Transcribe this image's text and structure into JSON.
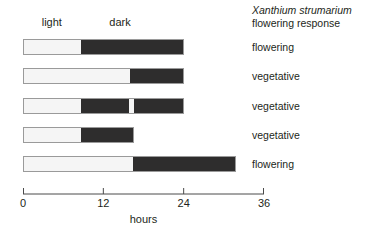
{
  "chart_data": {
    "type": "bar",
    "title": "Xanthium strumarium flowering response",
    "title_species": "Xanthium strumarium",
    "title_subtitle": "flowering response",
    "xlabel": "hours",
    "ylabel": "",
    "xlim": [
      0,
      36
    ],
    "xticks": [
      0,
      12,
      24,
      36
    ],
    "xtick_labels": [
      "0",
      "12",
      "24",
      "36"
    ],
    "grid": false,
    "legend_position": "top",
    "column_headers": [
      {
        "label": "light",
        "hours": 4.3
      },
      {
        "label": "dark",
        "hours": 14.5
      }
    ],
    "segment_colors": {
      "light": "#f5f5f5",
      "dark": "#2e2d2d",
      "border": "#9a9a9a"
    },
    "treatments": [
      {
        "name": "treatment-1",
        "response": "flowering",
        "total_hours": 24.0,
        "segments": [
          {
            "type": "light",
            "start": 0.0,
            "end": 8.6
          },
          {
            "type": "dark",
            "start": 8.6,
            "end": 24.0
          }
        ]
      },
      {
        "name": "treatment-2",
        "response": "vegetative",
        "total_hours": 24.0,
        "segments": [
          {
            "type": "light",
            "start": 0.0,
            "end": 16.0
          },
          {
            "type": "dark",
            "start": 16.0,
            "end": 24.0
          }
        ]
      },
      {
        "name": "treatment-3",
        "response": "vegetative",
        "total_hours": 24.0,
        "segments": [
          {
            "type": "light",
            "start": 0.0,
            "end": 8.6
          },
          {
            "type": "dark",
            "start": 8.6,
            "end": 15.8
          },
          {
            "type": "light",
            "start": 15.8,
            "end": 16.6
          },
          {
            "type": "dark",
            "start": 16.6,
            "end": 24.0
          }
        ]
      },
      {
        "name": "treatment-4",
        "response": "vegetative",
        "total_hours": 16.6,
        "segments": [
          {
            "type": "light",
            "start": 0.0,
            "end": 8.6
          },
          {
            "type": "dark",
            "start": 8.6,
            "end": 16.6
          }
        ]
      },
      {
        "name": "treatment-5",
        "response": "flowering",
        "total_hours": 31.8,
        "segments": [
          {
            "type": "light",
            "start": 0.0,
            "end": 16.4
          },
          {
            "type": "dark",
            "start": 16.4,
            "end": 31.8
          }
        ]
      }
    ]
  }
}
